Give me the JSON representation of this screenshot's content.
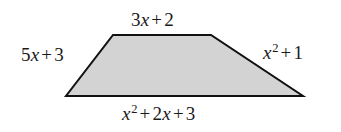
{
  "figure": {
    "type": "geometry-diagram",
    "shape_name": "trapezoid",
    "background_color": "#ffffff",
    "fill_color": "#d3d3d3",
    "stroke_color": "#111111",
    "stroke_width": 2,
    "vertices": {
      "top_left": [
        113,
        35
      ],
      "top_right": [
        211,
        35
      ],
      "bottom_right": [
        303,
        96
      ],
      "bottom_left": [
        66,
        96
      ]
    },
    "polygon_points": "113,35 211,35 303,96 66,96"
  },
  "labels": {
    "top": {
      "text": "3x + 2",
      "coefficient": "3",
      "variable": "x",
      "operator": "+",
      "constant": "2",
      "side": "top"
    },
    "left": {
      "text": "5x + 3",
      "coefficient": "5",
      "variable": "x",
      "operator": "+",
      "constant": "3",
      "side": "left"
    },
    "right": {
      "text": "x^2 + 1",
      "variable": "x",
      "exponent": "2",
      "operator": "+",
      "constant": "1",
      "side": "right"
    },
    "bottom": {
      "text": "x^2 + 2x + 3",
      "variable": "x",
      "exponent": "2",
      "operator1": "+",
      "coefficient2": "2",
      "variable2": "x",
      "operator2": "+",
      "constant": "3",
      "side": "bottom"
    }
  }
}
